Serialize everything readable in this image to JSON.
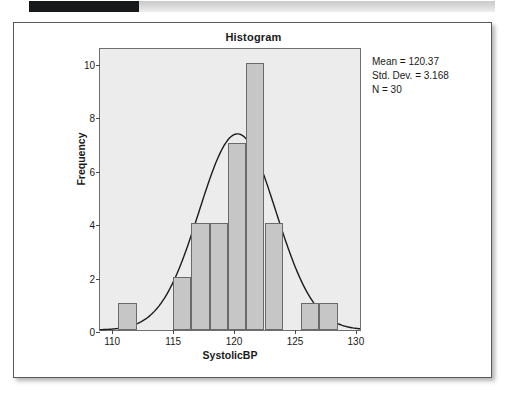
{
  "topbar": {
    "left_block": "",
    "right_block": ""
  },
  "chart_data": {
    "type": "bar",
    "title": "Histogram",
    "xlabel": "SystolicBP",
    "ylabel": "Frequency",
    "xlim": [
      109.0,
      130.5
    ],
    "ylim": [
      0,
      10.6
    ],
    "xticks": [
      110,
      115,
      120,
      125,
      130
    ],
    "yticks": [
      0,
      2,
      4,
      6,
      8,
      10
    ],
    "grid": false,
    "bin_width": 1.5,
    "bin_starts": [
      110.5,
      112.0,
      113.5,
      115.0,
      116.5,
      118.0,
      119.5,
      121.0,
      122.5,
      124.0,
      125.5,
      127.0
    ],
    "values": [
      1,
      0,
      0,
      2,
      4,
      4,
      7,
      10,
      4,
      0,
      1,
      1
    ],
    "overlay": {
      "type": "normal-curve",
      "mean": 120.37,
      "std_dev": 3.168,
      "n": 30,
      "peak_value": 7.4
    },
    "annotations": {
      "mean": "Mean = 120.37",
      "std_dev": "Std. Dev. = 3.168",
      "n": "N = 30"
    }
  }
}
